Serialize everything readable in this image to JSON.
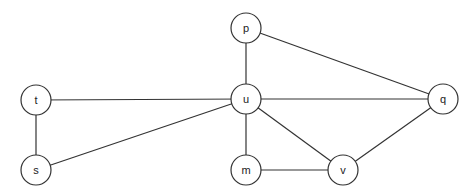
{
  "graph": {
    "node_radius": 15,
    "stroke_color": "#333333",
    "fill_color": "#ffffff",
    "nodes": [
      {
        "id": "t",
        "label": "t",
        "x": 36,
        "y": 100
      },
      {
        "id": "s",
        "label": "s",
        "x": 36,
        "y": 170
      },
      {
        "id": "p",
        "label": "p",
        "x": 246,
        "y": 28
      },
      {
        "id": "u",
        "label": "u",
        "x": 246,
        "y": 99
      },
      {
        "id": "m",
        "label": "m",
        "x": 246,
        "y": 170
      },
      {
        "id": "v",
        "label": "v",
        "x": 343,
        "y": 170
      },
      {
        "id": "q",
        "label": "q",
        "x": 443,
        "y": 99
      }
    ],
    "edges": [
      {
        "from": "t",
        "to": "u"
      },
      {
        "from": "t",
        "to": "s"
      },
      {
        "from": "s",
        "to": "u"
      },
      {
        "from": "p",
        "to": "u"
      },
      {
        "from": "p",
        "to": "q"
      },
      {
        "from": "u",
        "to": "q"
      },
      {
        "from": "u",
        "to": "m"
      },
      {
        "from": "u",
        "to": "v"
      },
      {
        "from": "m",
        "to": "v"
      },
      {
        "from": "v",
        "to": "q"
      }
    ]
  }
}
